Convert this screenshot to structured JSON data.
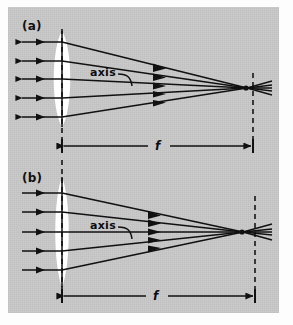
{
  "figure": {
    "name": "lens-focal-length-diagram",
    "background_color": "#c9c9c9",
    "ink_color": "#111111",
    "lens_fill": "#ffffff",
    "panels": [
      {
        "id": "a",
        "label": "(a)",
        "axis_label": "axis",
        "focal_label": "f",
        "description": "Parallel rays refracted by a thick biconvex lens converge to a focal point at distance f from the lens plane.",
        "lens": {
          "center_x": 62,
          "center_y": 79,
          "half_height": 48,
          "half_width": 17,
          "shape": "biconvex"
        },
        "lens_plane_x": 62,
        "focal_plane_x": 253,
        "focus_x": 247,
        "focus_y": 88,
        "ray_count": 5,
        "ray_y": [
          42,
          61,
          79,
          98,
          117
        ],
        "ray_start_x": 22,
        "mid_arrow_x": 162,
        "focal_dim_y": 146,
        "focal_length_px": 191
      },
      {
        "id": "b",
        "label": "(b)",
        "axis_label": "axis",
        "focal_label": "f",
        "description": "Parallel rays refracted by a thinner biconvex lens of longer focal length converge to a focal point at distance f.",
        "lens": {
          "center_x": 62,
          "center_y": 232,
          "half_height": 55,
          "half_width": 13,
          "shape": "biconvex"
        },
        "lens_plane_x": 62,
        "focal_plane_x": 255,
        "focus_x": 243,
        "focus_y": 232,
        "ray_count": 5,
        "ray_y": [
          193,
          212,
          232,
          251,
          270
        ],
        "ray_start_x": 22,
        "mid_arrow_x": 158,
        "focal_dim_y": 296,
        "focal_length_px": 193
      }
    ],
    "annotations": {
      "panel_a_label_pos": {
        "x": 22,
        "y": 20
      },
      "panel_b_label_pos": {
        "x": 22,
        "y": 172
      },
      "axis_label_a_pos": {
        "x": 92,
        "y": 73
      },
      "axis_label_b_pos": {
        "x": 92,
        "y": 226
      },
      "f_label_a_pos": {
        "x": 158,
        "y": 139
      },
      "f_label_b_pos": {
        "x": 156,
        "y": 289
      }
    }
  }
}
